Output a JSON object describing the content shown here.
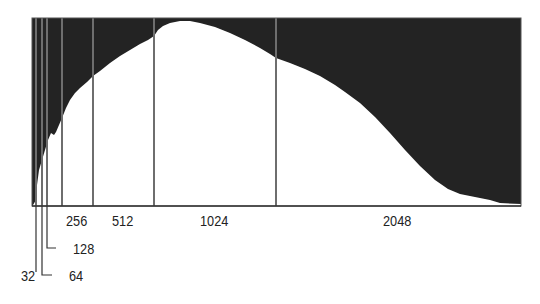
{
  "chart_data": {
    "type": "area",
    "title": "",
    "xlabel": "",
    "ylabel": "",
    "markers": [
      {
        "label": "32",
        "x_px": 36
      },
      {
        "label": "64",
        "x_px": 42
      },
      {
        "label": "128",
        "x_px": 47
      },
      {
        "label": "256",
        "x_px": 62
      },
      {
        "label": "512",
        "x_px": 93
      },
      {
        "label": "1024",
        "x_px": 154
      },
      {
        "label": "2048",
        "x_px": 276
      }
    ],
    "tick_labels": [
      "32",
      "64",
      "128",
      "256",
      "512",
      "1024",
      "2048"
    ],
    "curve_points_px": [
      [
        33,
        205
      ],
      [
        36,
        200
      ],
      [
        37,
        185
      ],
      [
        39,
        170
      ],
      [
        42,
        160
      ],
      [
        45,
        150
      ],
      [
        48,
        140
      ],
      [
        51,
        133
      ],
      [
        54,
        135
      ],
      [
        56,
        132
      ],
      [
        59,
        125
      ],
      [
        62,
        118
      ],
      [
        66,
        108
      ],
      [
        70,
        100
      ],
      [
        75,
        93
      ],
      [
        80,
        88
      ],
      [
        87,
        82
      ],
      [
        93,
        76
      ],
      [
        100,
        71
      ],
      [
        110,
        63
      ],
      [
        120,
        56
      ],
      [
        130,
        50
      ],
      [
        140,
        44
      ],
      [
        148,
        40
      ],
      [
        154,
        36
      ],
      [
        158,
        30
      ],
      [
        163,
        26
      ],
      [
        170,
        23
      ],
      [
        180,
        21
      ],
      [
        190,
        21
      ],
      [
        200,
        23
      ],
      [
        215,
        27
      ],
      [
        230,
        33
      ],
      [
        245,
        40
      ],
      [
        260,
        48
      ],
      [
        270,
        54
      ],
      [
        276,
        58
      ],
      [
        290,
        63
      ],
      [
        305,
        69
      ],
      [
        320,
        76
      ],
      [
        335,
        85
      ],
      [
        345,
        92
      ],
      [
        360,
        103
      ],
      [
        375,
        117
      ],
      [
        390,
        133
      ],
      [
        405,
        150
      ],
      [
        420,
        166
      ],
      [
        435,
        180
      ],
      [
        448,
        189
      ],
      [
        460,
        194
      ],
      [
        475,
        197
      ],
      [
        490,
        200
      ],
      [
        500,
        203
      ],
      [
        521,
        204
      ]
    ],
    "colors": {
      "background_fill": "#232323",
      "histogram_fill": "#ffffff",
      "marker_line": "#6e6e6e",
      "frame": "#555555"
    },
    "frame_px": {
      "left": 32,
      "top": 18,
      "right": 521,
      "bottom": 206
    }
  },
  "labels": {
    "l32": "32",
    "l64": "64",
    "l128": "128",
    "l256": "256",
    "l512": "512",
    "l1024": "1024",
    "l2048": "2048"
  }
}
